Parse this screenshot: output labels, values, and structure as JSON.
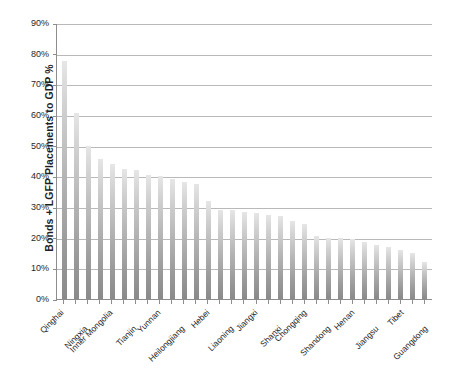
{
  "chart_data": {
    "type": "bar",
    "title": "",
    "xlabel": "",
    "ylabel": "Bonds + LGFP Placements to GDP %",
    "ylim": [
      0,
      90
    ],
    "ytick_labels": [
      "90%",
      "80%",
      "70%",
      "60%",
      "50%",
      "40%",
      "30%",
      "20%",
      "10%",
      "0%"
    ],
    "ytick_values": [
      90,
      80,
      70,
      60,
      50,
      40,
      30,
      20,
      10,
      0
    ],
    "grid": true,
    "legend": "none",
    "bar_color_top": "#e6e6e6",
    "bar_color_bottom": "#8a8a8a",
    "axis_color": "#8d8d8d",
    "gridline_color": "#b9b9b9",
    "categories": [
      "Qinghai",
      "Guizhou",
      "Ningxia",
      "Gansu",
      "Inner Mongolia",
      "Xinjiang",
      "Tianjin",
      "Jilin",
      "Yunnan",
      "Shaanxi",
      "Heilongjiang",
      "Hunan",
      "Hebei",
      "Sichuan",
      "Liaoning",
      "Anhui",
      "Jiangxi",
      "Hubei",
      "Shanxi",
      "Fujian",
      "Chongqing",
      "Guangxi",
      "Shandong",
      "Hainan",
      "Henan",
      "Zhejiang",
      "Jiangsu",
      "Beijing",
      "Tibet",
      "Shanghai",
      "Guangdong"
    ],
    "visible_tick_labels": [
      "Qinghai",
      "Ningxia",
      "Inner Mongolia",
      "Tianjin",
      "Yunnan",
      "Heilongjiang",
      "Hebei",
      "Liaoning",
      "Jiangxi",
      "Shanxi",
      "Chongqing",
      "Shandong",
      "Henan",
      "Jiangsu",
      "Tibet",
      "Guangdong"
    ],
    "values": [
      77.5,
      60.5,
      50.0,
      45.5,
      44.0,
      42.5,
      42.0,
      40.5,
      40.0,
      39.0,
      38.0,
      37.5,
      32.0,
      29.0,
      29.0,
      28.5,
      28.0,
      27.5,
      27.0,
      25.5,
      24.5,
      20.5,
      20.0,
      20.0,
      19.5,
      18.5,
      17.5,
      17.0,
      16.0,
      15.0,
      12.0
    ]
  }
}
